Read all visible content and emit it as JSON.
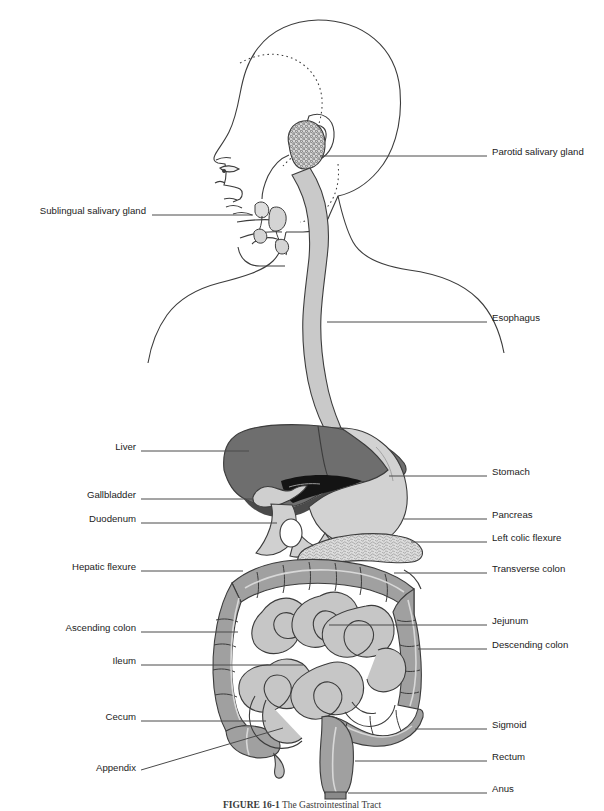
{
  "figure": {
    "caption_number": "FIGURE 16-1",
    "caption_title": "The Gastrointestinal Tract",
    "width": 604,
    "height": 811
  },
  "colors": {
    "outline": "#3c3c3c",
    "liver_dark": "#6e6e6e",
    "liver_shadow": "#4a4a4a",
    "stomach_light": "#d2d2d2",
    "gallbladder": "#cfcfcf",
    "colon_medium": "#a0a0a0",
    "colon_shadow": "#8a8a8a",
    "small_intestine": "#c6c6c6",
    "esophagus": "#c9c9c9",
    "pancreas": "#d8d8d8",
    "bile_duct_black": "#141414",
    "leader_line": "#4a4a4a",
    "label_text": "#1b1b1b",
    "background": "#ffffff"
  },
  "labels_left": [
    {
      "id": "sublingual-salivary-gland",
      "text": "Sublingual salivary gland",
      "text_x": 146,
      "text_y": 211,
      "line_x1": 152,
      "line_y1": 215,
      "line_x2": 253,
      "line_y2": 215
    },
    {
      "id": "liver",
      "text": "Liver",
      "text_x": 136,
      "text_y": 447,
      "line_x1": 141,
      "line_y1": 451,
      "line_x2": 249,
      "line_y2": 451
    },
    {
      "id": "gallbladder",
      "text": "Gallbladder",
      "text_x": 136,
      "text_y": 495,
      "line_x1": 141,
      "line_y1": 499,
      "line_x2": 253,
      "line_y2": 499
    },
    {
      "id": "duodenum",
      "text": "Duodenum",
      "text_x": 136,
      "text_y": 519,
      "line_x1": 141,
      "line_y1": 523,
      "line_x2": 277,
      "line_y2": 523
    },
    {
      "id": "hepatic-flexure",
      "text": "Hepatic flexure",
      "text_x": 136,
      "text_y": 567,
      "line_x1": 141,
      "line_y1": 571,
      "line_x2": 243,
      "line_y2": 571
    },
    {
      "id": "ascending-colon",
      "text": "Ascending colon",
      "text_x": 136,
      "text_y": 628,
      "line_x1": 141,
      "line_y1": 632,
      "line_x2": 238,
      "line_y2": 632
    },
    {
      "id": "ileum",
      "text": "Ileum",
      "text_x": 136,
      "text_y": 661,
      "line_x1": 141,
      "line_y1": 665,
      "line_x2": 303,
      "line_y2": 665
    },
    {
      "id": "cecum",
      "text": "Cecum",
      "text_x": 136,
      "text_y": 717,
      "line_x1": 141,
      "line_y1": 721,
      "line_x2": 266,
      "line_y2": 721
    },
    {
      "id": "appendix",
      "text": "Appendix",
      "text_x": 136,
      "text_y": 768,
      "line_x1": 141,
      "line_y1": 770,
      "line_x2": 283,
      "line_y2": 728
    }
  ],
  "labels_right": [
    {
      "id": "parotid-salivary-gland",
      "text": "Parotid salivary gland",
      "text_x": 492,
      "text_y": 152,
      "line_x1": 320,
      "line_y1": 156,
      "line_x2": 487,
      "line_y2": 156
    },
    {
      "id": "esophagus",
      "text": "Esophagus",
      "text_x": 492,
      "text_y": 318,
      "line_x1": 327,
      "line_y1": 322,
      "line_x2": 487,
      "line_y2": 322
    },
    {
      "id": "stomach",
      "text": "Stomach",
      "text_x": 492,
      "text_y": 472,
      "line_x1": 389,
      "line_y1": 476,
      "line_x2": 487,
      "line_y2": 476
    },
    {
      "id": "pancreas",
      "text": "Pancreas",
      "text_x": 492,
      "text_y": 515,
      "line_x1": 404,
      "line_y1": 519,
      "line_x2": 487,
      "line_y2": 519
    },
    {
      "id": "left-colic-flexure",
      "text": "Left colic flexure",
      "text_x": 492,
      "text_y": 538,
      "line_x1": 411,
      "line_y1": 542,
      "line_x2": 487,
      "line_y2": 542
    },
    {
      "id": "transverse-colon",
      "text": "Transverse colon",
      "text_x": 492,
      "text_y": 569,
      "line_x1": 394,
      "line_y1": 573,
      "line_x2": 487,
      "line_y2": 573
    },
    {
      "id": "jejunum",
      "text": "Jejunum",
      "text_x": 492,
      "text_y": 621,
      "line_x1": 329,
      "line_y1": 625,
      "line_x2": 487,
      "line_y2": 625
    },
    {
      "id": "descending-colon",
      "text": "Descending colon",
      "text_x": 492,
      "text_y": 645,
      "line_x1": 418,
      "line_y1": 649,
      "line_x2": 487,
      "line_y2": 649
    },
    {
      "id": "sigmoid",
      "text": "Sigmoid",
      "text_x": 492,
      "text_y": 725,
      "line_x1": 415,
      "line_y1": 729,
      "line_x2": 487,
      "line_y2": 729
    },
    {
      "id": "rectum",
      "text": "Rectum",
      "text_x": 492,
      "text_y": 757,
      "line_x1": 355,
      "line_y1": 761,
      "line_x2": 487,
      "line_y2": 761
    },
    {
      "id": "anus",
      "text": "Anus",
      "text_x": 492,
      "text_y": 789,
      "line_x1": 348,
      "line_y1": 793,
      "line_x2": 487,
      "line_y2": 793
    }
  ]
}
